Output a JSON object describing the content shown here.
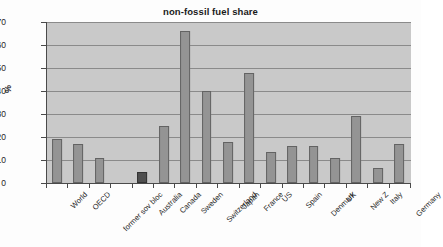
{
  "chart_data": {
    "type": "bar",
    "title": "non-fossil fuel share",
    "xlabel": "",
    "ylabel": "%",
    "ylim": [
      0,
      70
    ],
    "yticks": [
      0,
      10,
      20,
      30,
      40,
      50,
      60,
      70
    ],
    "grid": true,
    "legend": "none",
    "categories": [
      "World",
      "OECD",
      "former sov bloc",
      "",
      "Australia",
      "Canada",
      "Sweden",
      "Switzerland",
      "Japan",
      "France",
      "US",
      "Spain",
      "Denmark",
      "UK",
      "New Z",
      "Italy",
      "Germany"
    ],
    "values": [
      19,
      17,
      11,
      null,
      5,
      25,
      66,
      40,
      18,
      48,
      13.5,
      16,
      16,
      11,
      29,
      6.5,
      17
    ],
    "highlight_category": "Australia",
    "colors": {
      "bar": "#949494",
      "bar_border": "#636363",
      "bar_highlight": "#4f4f4f",
      "bar_highlight_border": "#333333",
      "plot_background": "#c9c9c9",
      "gridline": "#8a8a8a",
      "axis": "#4a4a4a",
      "text": "#1f1f1f",
      "page_background": "#fdfdfd"
    }
  }
}
